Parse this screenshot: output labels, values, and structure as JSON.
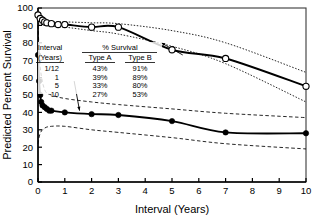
{
  "chart_data": {
    "type": "line",
    "title": "",
    "xlabel": "Interval (Years)",
    "ylabel": "Predicted Percent Survival",
    "xlim": [
      0,
      10
    ],
    "ylim": [
      0,
      100
    ],
    "xticks": [
      "0",
      "1",
      "2",
      "3",
      "4",
      "5",
      "6",
      "7",
      "8",
      "9",
      "10"
    ],
    "yticks": [
      "0",
      "10",
      "20",
      "30",
      "40",
      "50",
      "60",
      "70",
      "80",
      "90",
      "100"
    ],
    "grid": false,
    "legend_position": "none",
    "series": [
      {
        "name": "Type B",
        "marker": "open-circle",
        "line_style": "solid",
        "x": [
          0.0,
          0.083,
          0.17,
          0.25,
          0.33,
          0.5,
          0.75,
          1.0,
          2.0,
          3.0,
          5.0,
          7.0,
          10.0
        ],
        "values": [
          96,
          94,
          93,
          92,
          91.5,
          91,
          90.5,
          90.5,
          89,
          89,
          76,
          71,
          55
        ]
      },
      {
        "name": "Type A",
        "marker": "filled-circle",
        "line_style": "solid",
        "x": [
          0.0,
          0.04,
          0.083,
          0.12,
          0.17,
          0.25,
          0.33,
          0.42,
          0.5,
          1.0,
          2.0,
          3.0,
          5.0,
          7.0,
          10.0
        ],
        "values": [
          73,
          58,
          50,
          46,
          44,
          43,
          42,
          41,
          41,
          40,
          39,
          38.5,
          35,
          28.5,
          28
        ]
      },
      {
        "name": "Type B upper 95% CI",
        "marker": "none",
        "line_style": "dotted",
        "x": [
          0.0,
          0.5,
          1.0,
          2.0,
          3.0,
          5.0,
          7.0,
          10.0
        ],
        "values": [
          93,
          92,
          92,
          91.5,
          91,
          87,
          80,
          63
        ]
      },
      {
        "name": "Type B lower 95% CI",
        "marker": "none",
        "line_style": "dotted",
        "x": [
          0.0,
          0.5,
          1.0,
          2.0,
          3.0,
          5.0,
          7.0,
          10.0
        ],
        "values": [
          91,
          89.5,
          89,
          87,
          85,
          78,
          68,
          46
        ]
      },
      {
        "name": "Type A upper 95% CI",
        "marker": "none",
        "line_style": "dashed",
        "x": [
          0.0,
          0.083,
          0.25,
          0.5,
          1.0,
          2.0,
          3.0,
          5.0,
          7.0,
          10.0
        ],
        "values": [
          90,
          66,
          53,
          50,
          48,
          46,
          44.5,
          42,
          39.5,
          37
        ]
      },
      {
        "name": "Type A lower 95% CI",
        "marker": "none",
        "line_style": "dashed",
        "x": [
          0.0,
          0.083,
          0.25,
          0.5,
          1.0,
          2.0,
          3.0,
          5.0,
          7.0,
          10.0
        ],
        "values": [
          22,
          28,
          31,
          32,
          32,
          30,
          28.5,
          25.5,
          22,
          19
        ]
      }
    ],
    "annotations": [
      {
        "name": "type-a-pointer",
        "text": "",
        "from": [
          1.35,
          58
        ],
        "to": [
          1.55,
          41
        ]
      },
      {
        "name": "type-b-pointer",
        "text": "",
        "from": [
          5.4,
          73
        ],
        "to": [
          4.6,
          80
        ]
      }
    ]
  },
  "inset_table": {
    "col1_header_line1": "Interval",
    "col1_header_line2": "(Years)",
    "spanner_header": "% Survival",
    "col2_header": "Type A",
    "col3_header": "Type B",
    "rows": [
      {
        "interval": "1/12",
        "type_a": "43%",
        "type_b": "91%"
      },
      {
        "interval": "1",
        "type_a": "39%",
        "type_b": "89%"
      },
      {
        "interval": "5",
        "type_a": "33%",
        "type_b": "80%"
      },
      {
        "interval": "10",
        "type_a": "27%",
        "type_b": "53%"
      }
    ]
  },
  "colors": {
    "line": "#000000",
    "background": "#ffffff",
    "marker_fill_open": "#ffffff",
    "marker_fill_closed": "#000000"
  }
}
